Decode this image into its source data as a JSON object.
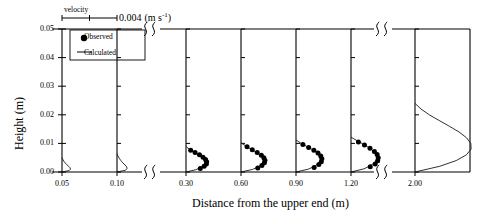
{
  "figure": {
    "y_axis": {
      "title": "Height (m)",
      "ticks": [
        "0.00",
        "0.01",
        "0.02",
        "0.03",
        "0.04",
        "0.05"
      ],
      "tick_values": [
        0.0,
        0.01,
        0.02,
        0.03,
        0.04,
        0.05
      ],
      "min": 0.0,
      "max": 0.05
    },
    "x_axis": {
      "title": "Distance from the upper end (m)",
      "ticks": [
        "0.05",
        "0.10",
        "0.30",
        "0.60",
        "0.90",
        "1.20",
        "2.00"
      ]
    },
    "scale_bar": {
      "label": "velocity",
      "value": "0.004",
      "unit_pre": "(m s",
      "unit_sup": "-1",
      "unit_post": ")"
    },
    "legend": {
      "observed": "Observed",
      "calculated": "Calculated"
    },
    "axis_breaks": 2,
    "colors": {
      "axis": "#000000",
      "calculated": "#1a1a1a",
      "observed": "#000000"
    }
  },
  "chart_data": {
    "type": "line",
    "title": "",
    "xlabel": "Distance from the upper end (m)",
    "ylabel": "Height (m)",
    "ylim": [
      0.0,
      0.05
    ],
    "velocity_scale_per_panel_unit": 0.004,
    "velocity_unit": "m s^-1",
    "grid": false,
    "legend": [
      "Observed",
      "Calculated"
    ],
    "legend_position": "top-left",
    "panels": [
      {
        "station": "0.05",
        "calculated": {
          "height": [
            0.0,
            0.0005,
            0.001,
            0.0015,
            0.002,
            0.0026,
            0.0032,
            0.0038,
            0.0044,
            0.005
          ],
          "velocity": [
            0.0,
            0.00052,
            0.00062,
            0.00058,
            0.00048,
            0.00034,
            0.00022,
            0.00013,
            6e-05,
            0.0
          ]
        },
        "observed": {
          "height": [],
          "velocity": []
        }
      },
      {
        "station": "0.10",
        "calculated": {
          "height": [
            0.0,
            0.0006,
            0.0012,
            0.0018,
            0.0025,
            0.0032,
            0.004,
            0.0048,
            0.0056,
            0.0064
          ],
          "velocity": [
            0.0,
            0.0006,
            0.00074,
            0.0007,
            0.00058,
            0.00042,
            0.00028,
            0.00016,
            7e-05,
            0.0
          ]
        },
        "observed": {
          "height": [],
          "velocity": []
        }
      },
      {
        "station": "0.30",
        "calculated": {
          "height": [
            0.0,
            0.0008,
            0.0016,
            0.0024,
            0.0032,
            0.004,
            0.0048,
            0.0056,
            0.0064,
            0.0072,
            0.008,
            0.009
          ],
          "velocity": [
            0.0,
            0.00072,
            0.00108,
            0.0013,
            0.0014,
            0.00138,
            0.00126,
            0.00104,
            0.00076,
            0.00048,
            0.00022,
            0.0
          ]
        },
        "observed": {
          "height": [
            0.0012,
            0.002,
            0.0028,
            0.0036,
            0.0044,
            0.0052,
            0.006,
            0.0068,
            0.0076
          ],
          "velocity": [
            0.00104,
            0.00132,
            0.00148,
            0.0015,
            0.00142,
            0.00124,
            0.00098,
            0.00066,
            0.00034
          ]
        }
      },
      {
        "station": "0.60",
        "calculated": {
          "height": [
            0.0,
            0.0009,
            0.0018,
            0.0027,
            0.0036,
            0.0045,
            0.0054,
            0.0063,
            0.0072,
            0.0082,
            0.0092,
            0.0102
          ],
          "velocity": [
            0.0,
            0.00084,
            0.00126,
            0.00152,
            0.00164,
            0.00164,
            0.00152,
            0.0013,
            0.001,
            0.00066,
            0.00032,
            0.0
          ]
        },
        "observed": {
          "height": [
            0.0014,
            0.0023,
            0.0032,
            0.0041,
            0.005,
            0.0059,
            0.0068,
            0.0078,
            0.0088
          ],
          "velocity": [
            0.00122,
            0.00152,
            0.0017,
            0.00174,
            0.00166,
            0.00148,
            0.00118,
            0.00082,
            0.00044
          ]
        }
      },
      {
        "station": "0.90",
        "calculated": {
          "height": [
            0.0,
            0.001,
            0.002,
            0.003,
            0.004,
            0.005,
            0.006,
            0.007,
            0.008,
            0.009,
            0.01,
            0.0112
          ],
          "velocity": [
            0.0,
            0.0009,
            0.00136,
            0.00164,
            0.00178,
            0.00178,
            0.00166,
            0.00144,
            0.00112,
            0.00076,
            0.00038,
            0.0
          ]
        },
        "observed": {
          "height": [
            0.0016,
            0.0026,
            0.0036,
            0.0046,
            0.0056,
            0.0066,
            0.0076,
            0.0086,
            0.0096
          ],
          "velocity": [
            0.00132,
            0.00166,
            0.00184,
            0.00188,
            0.0018,
            0.0016,
            0.0013,
            0.00092,
            0.0005
          ]
        }
      },
      {
        "station": "1.20",
        "calculated": {
          "height": [
            0.0,
            0.0011,
            0.0022,
            0.0033,
            0.0044,
            0.0055,
            0.0066,
            0.0077,
            0.0088,
            0.0099,
            0.011,
            0.0122
          ],
          "velocity": [
            0.0,
            0.00094,
            0.00142,
            0.00172,
            0.00186,
            0.00188,
            0.00176,
            0.00154,
            0.00122,
            0.00084,
            0.00042,
            0.0
          ]
        },
        "observed": {
          "height": [
            0.0018,
            0.0028,
            0.0039,
            0.005,
            0.0061,
            0.0072,
            0.0083,
            0.0094,
            0.0105
          ],
          "velocity": [
            0.0014,
            0.00176,
            0.00194,
            0.00198,
            0.0019,
            0.0017,
            0.00138,
            0.00098,
            0.00054
          ]
        }
      },
      {
        "station": "2.00",
        "calculated": {
          "height": [
            0.0,
            0.002,
            0.004,
            0.006,
            0.008,
            0.01,
            0.012,
            0.014,
            0.016,
            0.018,
            0.02,
            0.022,
            0.024
          ],
          "velocity": [
            0.0,
            0.0018,
            0.003,
            0.00374,
            0.00408,
            0.00406,
            0.00374,
            0.0032,
            0.0025,
            0.00176,
            0.00104,
            0.00044,
            0.0
          ]
        },
        "observed": {
          "height": [],
          "velocity": []
        }
      }
    ]
  }
}
